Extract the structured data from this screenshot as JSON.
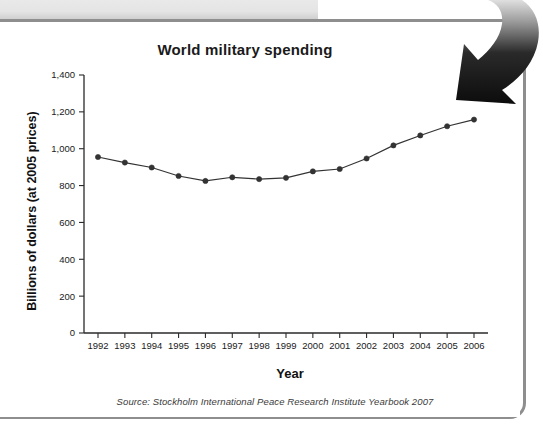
{
  "page": {
    "background_color": "#ffffff",
    "frame_color": "#8e8e8e",
    "top_band_color": "#e4e4e4"
  },
  "decor": {
    "arrow_icon_name": "curved-down-arrow-icon",
    "arrow_color": "#111111"
  },
  "chart_data": {
    "type": "line",
    "title": "World military spending",
    "xlabel": "Year",
    "ylabel": "Billions of dollars (at 2005 prices)",
    "categories": [
      "1992",
      "1993",
      "1994",
      "1995",
      "1996",
      "1997",
      "1998",
      "1999",
      "2000",
      "2001",
      "2002",
      "2003",
      "2004",
      "2005",
      "2006"
    ],
    "values": [
      955,
      925,
      898,
      852,
      825,
      845,
      835,
      842,
      877,
      890,
      947,
      1018,
      1072,
      1122,
      1158
    ],
    "series": [
      {
        "name": "World military spending",
        "values": [
          955,
          925,
          898,
          852,
          825,
          845,
          835,
          842,
          877,
          890,
          947,
          1018,
          1072,
          1122,
          1158
        ]
      }
    ],
    "ylim": [
      0,
      1400
    ],
    "ytick_values": [
      0,
      200,
      400,
      600,
      800,
      1000,
      1200,
      1400
    ],
    "ytick_labels": [
      "0",
      "200",
      "400",
      "600",
      "800",
      "1,000",
      "1,200",
      "1,400"
    ],
    "grid": false,
    "legend": "none",
    "marker": "circle",
    "line_color": "#333333",
    "marker_color": "#333333",
    "source_note": "Source: Stockholm International Peace Research Institute Yearbook 2007"
  }
}
